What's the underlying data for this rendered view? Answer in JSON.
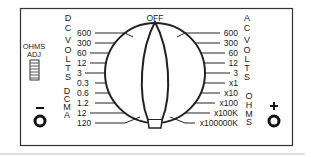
{
  "dial": {
    "off_label": "OFF",
    "dc_volts_title": "DC VOLTS",
    "dc_ma_title": "DCMA",
    "ac_volts_title": "AC VOLTS",
    "ohms_title": "OHMS",
    "ohms_adj_line1": "OHMS",
    "ohms_adj_line2": "ADJ",
    "minus_label": "–",
    "plus_label": "+",
    "left_ranges": [
      "600",
      "300",
      "60",
      "12",
      "3",
      "0.3",
      "0.6",
      "1.2",
      "12",
      "120"
    ],
    "right_ranges": [
      "600",
      "300",
      "60",
      "12",
      "3",
      "x1",
      "x10",
      "x100",
      "x100K",
      "x100000K"
    ]
  }
}
